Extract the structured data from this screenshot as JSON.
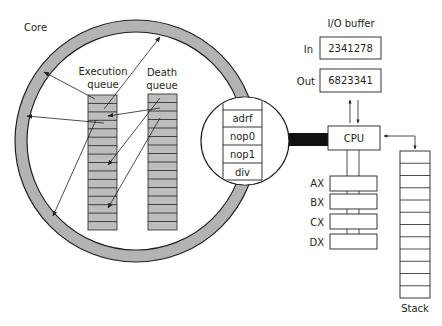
{
  "colors": {
    "ring_fill": "#b3b3b3",
    "queue_fill": "#bdbdbd",
    "stroke": "#231f20",
    "bus": "#111111",
    "background": "#ffffff"
  },
  "core": {
    "label": "Core",
    "execution_queue": {
      "label_line1": "Execution",
      "label_line2": "queue",
      "rows": 16
    },
    "death_queue": {
      "label_line1": "Death",
      "label_line2": "queue",
      "rows": 16
    }
  },
  "inset": {
    "instructions": [
      "",
      "adrf",
      "nop0",
      "nop1",
      "div"
    ]
  },
  "io_buffer": {
    "title": "I/O buffer",
    "in_label": "In",
    "in_value": "2341278",
    "out_label": "Out",
    "out_value": "6823341"
  },
  "cpu": {
    "label": "CPU"
  },
  "registers": [
    {
      "name": "AX"
    },
    {
      "name": "BX"
    },
    {
      "name": "CX"
    },
    {
      "name": "DX"
    }
  ],
  "stack": {
    "label": "Stack",
    "rows": 12
  }
}
